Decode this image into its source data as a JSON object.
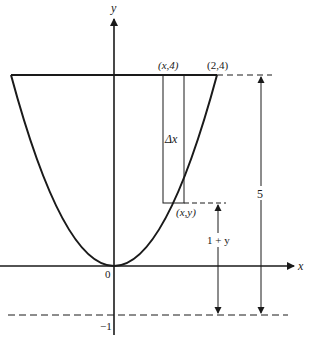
{
  "figure": {
    "type": "parabola-region-diagram",
    "curve": "y = x^2",
    "axes": {
      "x_label": "x",
      "y_label": "y",
      "origin_label": "0",
      "neg_one_label": "−1"
    },
    "points": {
      "top_left_rect": "(x,4)",
      "top_right": "(2,4)",
      "curve_point": "(x,y)"
    },
    "labels": {
      "strip_width": "Δx",
      "distance_total": "5",
      "distance_partial": "1 + y"
    },
    "colors": {
      "stroke": "#1a1a1a",
      "background": "#ffffff"
    }
  }
}
